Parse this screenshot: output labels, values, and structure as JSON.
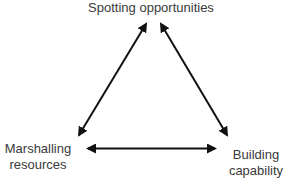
{
  "diagram": {
    "type": "triangle-cycle",
    "nodes": {
      "top": {
        "line1": "Spotting opportunities"
      },
      "left": {
        "line1": "Marshalling",
        "line2": "resources"
      },
      "right": {
        "line1": "Building",
        "line2": "capability"
      }
    },
    "edges": [
      {
        "from": "top",
        "to": "left",
        "style": "double-headed arrow"
      },
      {
        "from": "top",
        "to": "right",
        "style": "double-headed arrow"
      },
      {
        "from": "left",
        "to": "right",
        "style": "double-headed arrow"
      }
    ],
    "colors": {
      "text": "#3a3a3a",
      "arrow": "#111111",
      "background": "#ffffff"
    }
  }
}
